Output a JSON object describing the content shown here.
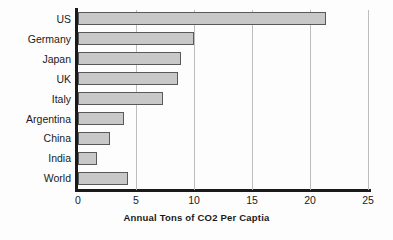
{
  "chart_data": {
    "type": "bar",
    "orientation": "horizontal",
    "title": "",
    "subtitle": "",
    "xlabel": "Annual Tons of CO2 Per Captia",
    "ylabel": "",
    "categories": [
      "US",
      "Germany",
      "Japan",
      "UK",
      "Italy",
      "Argentina",
      "China",
      "India",
      "World"
    ],
    "values": [
      21.4,
      10.0,
      8.9,
      8.6,
      7.3,
      4.0,
      2.8,
      1.6,
      4.3
    ],
    "xlim": [
      0,
      25
    ],
    "xticks": [
      0,
      5,
      10,
      15,
      20,
      25
    ],
    "xtick_labels": [
      "0",
      "5",
      "10",
      "15",
      "20",
      "25"
    ],
    "grid": "vertical",
    "legend": "none",
    "bar_fill_color": "#c8c8c8",
    "bar_edge_color": "#595959",
    "axis_color": "#1a1a1a",
    "gridline_color": "#bdbdbd",
    "background_color": "#fdfdfd"
  }
}
